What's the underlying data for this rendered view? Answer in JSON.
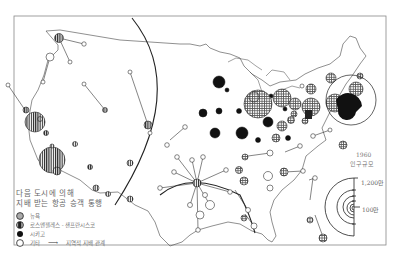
{
  "legend": {
    "title_line1": "다음 도시에 의해",
    "title_line2": "지배 받는 항공 승객 통행",
    "items": [
      {
        "symbol": "grey-dotted-circle",
        "label": "뉴욕"
      },
      {
        "symbol": "vertical-hatched-circle",
        "label": "로스앤젤레스 - 샌프란시스코"
      },
      {
        "symbol": "black-circle",
        "label": "시카고"
      },
      {
        "symbol": "white-circle",
        "label": "기타"
      }
    ],
    "arrow_label": "지역적 지배 관계"
  },
  "scale": {
    "year": "1960",
    "unit_label": "인구규모",
    "max_label": "1,200만",
    "min_label": "100만"
  },
  "colors": {
    "new_york": "#bfbfbf",
    "la_sf": "#9a9a9a",
    "chicago": "#111111",
    "other": "#ffffff",
    "line": "#333333"
  }
}
